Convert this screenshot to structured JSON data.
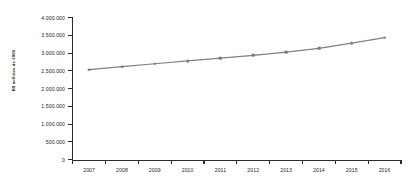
{
  "chart_data": {
    "type": "line",
    "title": "",
    "subtitle": "",
    "xlabel": "",
    "ylabel": "R$ milhões de 2006",
    "categories": [
      "2007",
      "2008",
      "2009",
      "2010",
      "2011",
      "2012",
      "2013",
      "2014",
      "2015",
      "2016"
    ],
    "values": [
      2535000,
      2620000,
      2700000,
      2780000,
      2860000,
      2935000,
      3030000,
      3130000,
      3280000,
      3436000
    ],
    "series": [
      {
        "name": "",
        "values": [
          2535000,
          2620000,
          2700000,
          2780000,
          2860000,
          2935000,
          3030000,
          3130000,
          3280000,
          3436000
        ]
      }
    ],
    "ylim": [
      0,
      4000000
    ],
    "ytick_values": [
      0,
      500000,
      1000000,
      1500000,
      2000000,
      2500000,
      3000000,
      3500000,
      4000000
    ],
    "ytick_labels": [
      "0",
      "500.000",
      "1.000.000",
      "1.500.000",
      "2.000.000",
      "2.500.000",
      "3.000.000",
      "3.500.000",
      "4.000.000"
    ],
    "xtick_labels": [
      "2007",
      "2008",
      "2009",
      "2010",
      "2011",
      "2012",
      "2013",
      "2014",
      "2015",
      "2016"
    ],
    "grid": false,
    "legend": false,
    "legend_position": "none",
    "marker": "square",
    "line_color": "#808080",
    "marker_color": "#777777",
    "axis_color": "#2b2b2b",
    "background_color": "#ffffff",
    "annotations": []
  }
}
